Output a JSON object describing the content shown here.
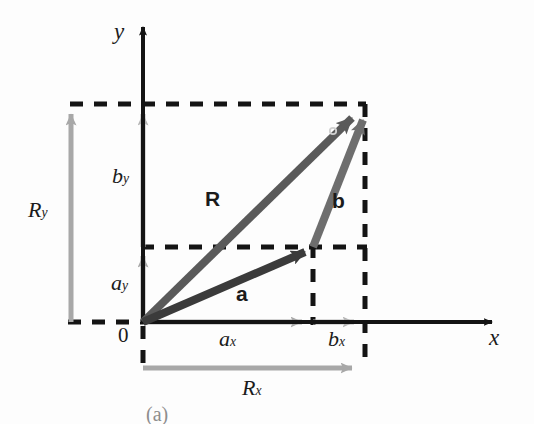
{
  "figure": {
    "caption": "(a)",
    "origin_label": "0",
    "axes": {
      "x_label": "x",
      "y_label": "y"
    },
    "vectors": [
      {
        "id": "a",
        "label": "a",
        "color": "#3b3b3b",
        "from": [
          143,
          322
        ],
        "to": [
          318,
          246
        ],
        "label_pos": [
          242,
          293
        ]
      },
      {
        "id": "b",
        "label": "b",
        "color": "#6e6e6e",
        "from": [
          313,
          247
        ],
        "to": [
          368,
          107
        ],
        "label_pos": [
          338,
          200
        ]
      },
      {
        "id": "R",
        "label": "R",
        "color": "#5a5a5a",
        "from": [
          143,
          322
        ],
        "to": [
          366,
          104
        ],
        "label_pos": [
          213,
          198
        ]
      }
    ],
    "components": [
      {
        "id": "ax",
        "label": "a",
        "sub": "x",
        "color": "#9b9b9b",
        "label_pos": [
          228,
          339
        ]
      },
      {
        "id": "bx",
        "label": "b",
        "sub": "x",
        "color": "#b3b3b3",
        "label_pos": [
          337,
          339
        ]
      },
      {
        "id": "Rx",
        "label": "R",
        "sub": "x",
        "color": "#a8a8a8",
        "label_pos": [
          252,
          388
        ]
      },
      {
        "id": "ay",
        "label": "a",
        "sub": "y",
        "color": "#9b9b9b",
        "label_pos": [
          119,
          284
        ]
      },
      {
        "id": "by",
        "label": "b",
        "sub": "y",
        "color": "#b3b3b3",
        "label_pos": [
          120,
          177
        ]
      },
      {
        "id": "Ry",
        "label": "R",
        "sub": "y",
        "color": "#a8a8a8",
        "label_pos": [
          37,
          211
        ]
      }
    ],
    "colors": {
      "axis": "#141414",
      "dashed": "#141414",
      "vector_a": "#3b3b3b",
      "vector_b": "#6e6e6e",
      "vector_R": "#5a5a5a",
      "component_light": "#a8a8a8",
      "background": "#fdfdfd"
    },
    "geometry": {
      "origin": [
        143,
        322
      ],
      "x_axis_end": [
        500,
        322
      ],
      "y_axis_top": [
        143,
        18
      ],
      "dash_top_y": 104,
      "dash_mid_y": 247,
      "dash_x_left": 70,
      "dash_v_ax": 313,
      "dash_v_bx": 365,
      "Rx_bar_y": 368,
      "Ry_bar_x": 71
    }
  }
}
